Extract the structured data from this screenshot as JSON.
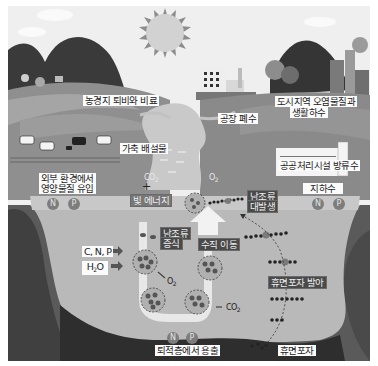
{
  "diagram": {
    "title": "",
    "palette": {
      "sky": "#eeeeee",
      "far_hill": "#3c3c3c",
      "field": "#8a8a8a",
      "field_light": "#a6a6a6",
      "lake": "#b9b9b9",
      "lake_surface": "#c8c8c8",
      "bank": "#5a5a5a",
      "sediment": "#2e2e2e",
      "sun": "#cdcdcd",
      "label_bg": "#fbfbfb",
      "dark_label_bg": "#4a4a4a"
    },
    "sources": {
      "farmland": "농경지 퇴비와 비료",
      "livestock": "가축 배설물",
      "external_inflow_line1": "외부 환경에서",
      "external_inflow_line2": "영양물질 유입",
      "factory": "공장 폐수",
      "urban_line1": "도시지역 오염물질과",
      "urban_line2": "생활하수",
      "treatment": "공공처리시설 방류수",
      "groundwater": "지하수"
    },
    "gases": {
      "co2_top": "CO",
      "co2_top_sub": "2",
      "o2_top": "O",
      "o2_top_sub": "2",
      "o2_mid": "O",
      "o2_mid_sub": "2",
      "co2_bottom": "CO",
      "co2_bottom_sub": "2"
    },
    "process": {
      "plus": "+",
      "light_energy": "빛 에너지",
      "algae_growth_line1": "남조류",
      "algae_growth_line2": "증식",
      "algae_bloom_line1": "남조류",
      "algae_bloom_line2": "대발생",
      "vertical_migration": "수직 이동",
      "akinete_germination": "휴면포자 발아",
      "akinete": "휴면포자",
      "sediment_release": "퇴적층에서 용출"
    },
    "inputs": {
      "cnp": "C, N, P",
      "water": "H",
      "water_sub": "2",
      "water_end": "O"
    },
    "nutrients": {
      "n": "N",
      "p": "P"
    }
  }
}
